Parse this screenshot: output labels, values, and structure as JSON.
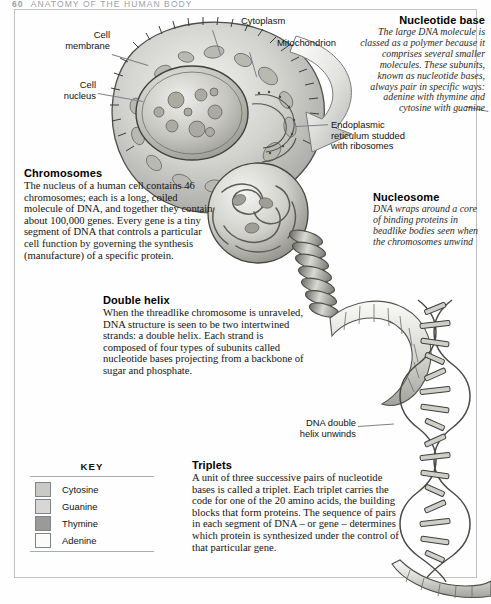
{
  "running_head": {
    "folio": "60",
    "title": "ANATOMY OF THE HUMAN BODY"
  },
  "labels": {
    "cell_membrane": "Cell\nmembrane",
    "cell_nucleus": "Cell\nnucleus",
    "cytoplasm": "Cytoplasm",
    "mitochondrion": "Mitochondrion",
    "endoplasmic_reticulum": "Endoplasmic\nreticulum studded\nwith ribosomes",
    "dna_double_helix_unwinds": "DNA double\nhelix unwinds"
  },
  "nucleotide_base": {
    "heading": "Nucleotide base",
    "text": "The large DNA molecule is classed as a polymer because it comprises several smaller molecules. These subunits, known as nucleotide bases, always pair in specific ways: adenine with thymine and cytosine with guanine"
  },
  "nucleosome": {
    "heading": "Nucleosome",
    "text": "DNA wraps around a core of binding proteins in beadlike bodies seen when the chromosomes unwind"
  },
  "chromosomes": {
    "heading": "Chromosomes",
    "text": "The nucleus of a human cell contains 46 chromosomes; each is a long, coiled molecule of DNA, and together they contain about 100,000 genes. Every gene is a tiny segment of DNA that controls a particular cell function by governing the synthesis (manufacture) of a specific protein."
  },
  "double_helix": {
    "heading": "Double helix",
    "text": "When the threadlike chromosome is unraveled, DNA structure is seen to be two intertwined strands: a double helix. Each strand is composed of four types of subunits called nucleotide bases projecting from a backbone of sugar and phosphate."
  },
  "triplets": {
    "heading": "Triplets",
    "text": "A unit of three successive pairs of nucleotide bases is called a triplet. Each triplet carries the code for one of the 20 amino acids, the building blocks that form proteins. The sequence of pairs in each segment of DNA – or gene – determines which protein is synthesized under the control of that particular gene."
  },
  "key": {
    "title": "KEY",
    "items": [
      {
        "label": "Cytosine",
        "color": "#c9c9c7"
      },
      {
        "label": "Guanine",
        "color": "#d7d7d5"
      },
      {
        "label": "Thymine",
        "color": "#9a9a98"
      },
      {
        "label": "Adenine",
        "color": "#fbfbfa"
      }
    ]
  }
}
